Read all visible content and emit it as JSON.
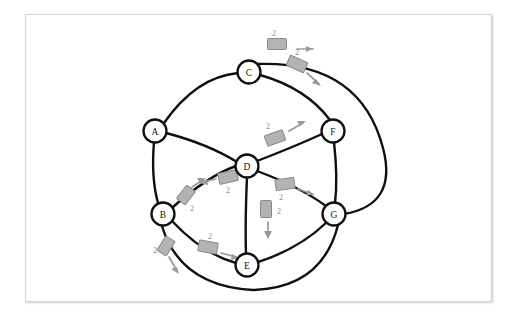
{
  "diagram": {
    "background_color": "#ffffff",
    "frame_color": "#d2d2d2",
    "edge_color": "#101010",
    "node_fill": "#ffffff",
    "packet_fill": "#b3b3b3",
    "packet_stroke": "#8a8a8a",
    "arrow_color": "#9a9a9a",
    "nodes": [
      {
        "id": "A",
        "label": "A",
        "x": 155,
        "y": 131,
        "r": 11.5
      },
      {
        "id": "B",
        "label": "B",
        "x": 163,
        "y": 214,
        "r": 11.5
      },
      {
        "id": "C",
        "label": "C",
        "x": 249,
        "y": 72,
        "r": 11.5
      },
      {
        "id": "D",
        "label": "D",
        "x": 247,
        "y": 166,
        "r": 11.5
      },
      {
        "id": "E",
        "label": "E",
        "x": 247,
        "y": 265,
        "r": 11.5
      },
      {
        "id": "F",
        "label": "F",
        "x": 333,
        "y": 131,
        "r": 11.5
      },
      {
        "id": "G",
        "label": "G",
        "x": 334,
        "y": 214,
        "r": 11.5
      }
    ],
    "edges": [
      {
        "id": "A-C",
        "from": "A",
        "to": "C",
        "path": "M 164 123 Q 196 77 238 73"
      },
      {
        "id": "C-F",
        "from": "C",
        "to": "F",
        "path": "M 260 75 Q 306 88 330 120"
      },
      {
        "id": "A-D",
        "from": "A",
        "to": "D",
        "path": "M 166 133 Q 208 144 237 162"
      },
      {
        "id": "A-B",
        "from": "A",
        "to": "B",
        "path": "M 154 142 Q 151 178 158 203"
      },
      {
        "id": "D-F",
        "from": "D",
        "to": "F",
        "path": "M 257 161 Q 296 146 322 134"
      },
      {
        "id": "B-D",
        "from": "B",
        "to": "D",
        "path": "M 173 207 Q 208 176 236 166"
      },
      {
        "id": "D-E",
        "from": "D",
        "to": "E",
        "path": "M 247 177 Q 245 223 246 254"
      },
      {
        "id": "D-G",
        "from": "D",
        "to": "G",
        "path": "M 257 171 Q 300 187 326 206"
      },
      {
        "id": "B-E",
        "from": "B",
        "to": "E",
        "path": "M 172 221 Q 203 254 236 263"
      },
      {
        "id": "E-G",
        "from": "E",
        "to": "G",
        "path": "M 258 262 Q 299 249 327 222"
      },
      {
        "id": "F-G",
        "from": "F",
        "to": "G",
        "path": "M 334 142 Q 338 178 335 203"
      },
      {
        "id": "C-G-outer",
        "from": "C",
        "to": "G",
        "path": "M 256 64 Q 360 60 383 148 Q 398 205 344 214"
      },
      {
        "id": "B-G-outer",
        "from": "B",
        "to": "G",
        "path": "M 162 226 Q 180 286 253 290 Q 322 288 338 225"
      }
    ],
    "packets": [
      {
        "id": "pkt-c-out-top",
        "label": "2",
        "x": 277,
        "y": 44,
        "w": 19,
        "h": 11,
        "rot": 0,
        "num_x": 274,
        "num_y": 33,
        "arrow": "M 297 49 L 313 49",
        "head": "313,49 306,46 306,52"
      },
      {
        "id": "pkt-c-to-f",
        "label": "2",
        "x": 297,
        "y": 64,
        "w": 19,
        "h": 11,
        "rot": 24,
        "num_x": 297,
        "num_y": 52,
        "arrow": "M 307 73 L 319 84",
        "head": "321,86 312,83 316,79"
      },
      {
        "id": "pkt-d-to-f",
        "label": "2",
        "x": 275,
        "y": 138,
        "w": 19,
        "h": 11,
        "rot": -20,
        "num_x": 268,
        "num_y": 126,
        "arrow": "M 289 131 L 303 123",
        "head": "306,121 297,121 300,126"
      },
      {
        "id": "pkt-d-to-b",
        "label": "2",
        "x": 228,
        "y": 177,
        "w": 19,
        "h": 11,
        "rot": -12,
        "num_x": 228,
        "num_y": 190,
        "arrow": "M 216 179 L 202 182",
        "head": "199,183 207,179 208,185"
      },
      {
        "id": "pkt-b-to-d",
        "label": "2",
        "x": 186,
        "y": 195,
        "w": 11,
        "h": 17,
        "rot": 38,
        "num_x": 192,
        "num_y": 208,
        "arrow": "M 192 187 L 203 180",
        "head": "206,178 197,178 200,183"
      },
      {
        "id": "pkt-d-to-g",
        "label": "2",
        "x": 285,
        "y": 184,
        "w": 19,
        "h": 11,
        "rot": -8,
        "num_x": 281,
        "num_y": 197,
        "arrow": "M 298 189 L 312 194",
        "head": "315,195 306,195 308,190"
      },
      {
        "id": "pkt-d-to-e",
        "label": "2",
        "x": 266,
        "y": 209,
        "w": 11,
        "h": 17,
        "rot": 0,
        "num_x": 279,
        "num_y": 211,
        "arrow": "M 268 222 L 268 236",
        "head": "268,239 264,231 272,231"
      },
      {
        "id": "pkt-b-to-e",
        "label": "2",
        "x": 208,
        "y": 247,
        "w": 19,
        "h": 11,
        "rot": 10,
        "num_x": 210,
        "num_y": 236,
        "arrow": "M 221 253 L 236 257",
        "head": "239,258 231,260 232,254"
      },
      {
        "id": "pkt-b-out-left",
        "label": "2",
        "x": 166,
        "y": 246,
        "w": 11,
        "h": 17,
        "rot": 32,
        "num_x": 155,
        "num_y": 250,
        "arrow": "M 169 257 L 177 271",
        "head": "179,274 171,269 177,267"
      }
    ]
  }
}
